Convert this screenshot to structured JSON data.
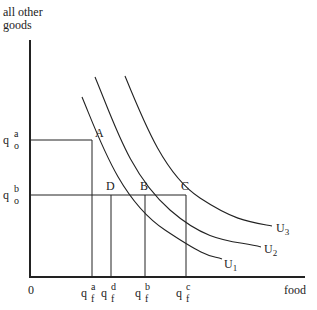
{
  "diagram": {
    "type": "indifference-curves",
    "y_axis_label_line1": "all other",
    "y_axis_label_line2": "goods",
    "x_axis_label": "food",
    "origin_label": "0",
    "curves": [
      {
        "id": "U1",
        "label_base": "U",
        "label_sub": "1"
      },
      {
        "id": "U2",
        "label_base": "U",
        "label_sub": "2"
      },
      {
        "id": "U3",
        "label_base": "U",
        "label_sub": "3"
      }
    ],
    "points": [
      {
        "label": "A",
        "curve": "U2"
      },
      {
        "label": "D",
        "curve": "U1"
      },
      {
        "label": "B",
        "curve": "U2"
      },
      {
        "label": "C",
        "curve": "U3"
      }
    ],
    "y_ticks": [
      {
        "base": "q",
        "sup": "a",
        "sub": "o"
      },
      {
        "base": "q",
        "sup": "b",
        "sub": "o"
      }
    ],
    "x_ticks": [
      {
        "base": "q",
        "sup": "a",
        "sub": "f"
      },
      {
        "base": "q",
        "sup": "d",
        "sub": "f"
      },
      {
        "base": "q",
        "sup": "b",
        "sub": "f"
      },
      {
        "base": "q",
        "sup": "c",
        "sub": "f"
      }
    ],
    "line_color": "#222222"
  }
}
